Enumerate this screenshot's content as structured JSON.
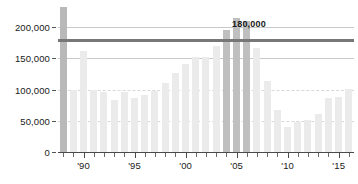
{
  "chart_data": {
    "type": "bar",
    "title": "",
    "subtitle": "",
    "xlabel": "",
    "ylabel": "",
    "ylim": [
      0,
      240000
    ],
    "xlim": [
      1988,
      2016
    ],
    "grid": true,
    "legend_position": "none",
    "y_ticks": [
      {
        "value": 0,
        "label": "0"
      },
      {
        "value": 50000,
        "label": "50,000"
      },
      {
        "value": 100000,
        "label": "100,000"
      },
      {
        "value": 150000,
        "label": "150,000"
      },
      {
        "value": 200000,
        "label": "200,000"
      }
    ],
    "x_ticks": [
      {
        "value": 1990,
        "label": "'90"
      },
      {
        "value": 1995,
        "label": "'95"
      },
      {
        "value": 2000,
        "label": "'00"
      },
      {
        "value": 2005,
        "label": "'05"
      },
      {
        "value": 2010,
        "label": "'10"
      },
      {
        "value": 2015,
        "label": "'15"
      }
    ],
    "annotations": [
      {
        "type": "threshold-line",
        "value": 180000,
        "label": "180,000",
        "color": "#777777"
      }
    ],
    "colors": {
      "bar_default": "#ebebeb",
      "bar_highlight": "#bfbfbf",
      "bar_first": "#b9b9b9",
      "gridline": "#c9c9c9",
      "gridline_dashed": "#d8d8d8",
      "axis": "#4a4a4a",
      "threshold": "#777777",
      "text": "#1a1a1a",
      "background": "#ffffff"
    },
    "categories": [
      1988,
      1989,
      1990,
      1991,
      1992,
      1993,
      1994,
      1995,
      1996,
      1997,
      1998,
      1999,
      2000,
      2001,
      2002,
      2003,
      2004,
      2005,
      2006,
      2007,
      2008,
      2009,
      2010,
      2011,
      2012,
      2013,
      2014,
      2015,
      2016
    ],
    "values": [
      232000,
      100000,
      161000,
      100000,
      96000,
      83000,
      96000,
      87000,
      92000,
      97000,
      110000,
      126000,
      141000,
      152000,
      152000,
      170000,
      196000,
      214000,
      210000,
      166000,
      114000,
      67000,
      40000,
      48000,
      51000,
      61000,
      87000,
      88000,
      101000
    ],
    "highlight_indices": [
      16,
      17,
      18
    ],
    "first_bar_index": 0
  }
}
